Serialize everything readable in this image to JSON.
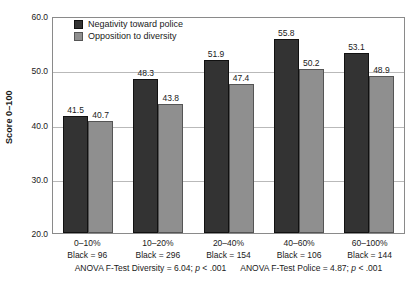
{
  "chart_data": {
    "type": "bar",
    "title": "",
    "xlabel": "",
    "ylabel": "Score 0–100",
    "ylim": [
      20.0,
      60.0
    ],
    "ytick_labels": [
      "60.0",
      "50.0",
      "40.0",
      "30.0",
      "20.0"
    ],
    "ytick_values": [
      60.0,
      50.0,
      40.0,
      30.0,
      20.0
    ],
    "grid": true,
    "legend_position": "top-left-inside",
    "categories": [
      "0–10%",
      "10–20%",
      "20–40%",
      "40–60%",
      "60–100%"
    ],
    "category_sublabels": [
      "Black = 96",
      "Black = 296",
      "Black = 154",
      "Black = 106",
      "Black = 144"
    ],
    "series": [
      {
        "name": "Negativity toward police",
        "color": "#333333",
        "values": [
          41.5,
          48.3,
          51.9,
          55.8,
          53.1
        ],
        "value_labels": [
          "41.5",
          "48.3",
          "51.9",
          "55.8",
          "53.1"
        ]
      },
      {
        "name": "Opposition to diversity",
        "color": "#8f8f8f",
        "values": [
          40.7,
          43.8,
          47.4,
          50.2,
          48.9
        ],
        "value_labels": [
          "40.7",
          "43.8",
          "47.4",
          "50.2",
          "48.9"
        ]
      }
    ],
    "annotations": [
      "ANOVA F-Test Diversity = 6.04; p < .001",
      "ANOVA F-Test Police = 4.87; p < .001"
    ]
  },
  "footnote": {
    "diversity_prefix": "ANOVA F-Test Diversity = 6.04; ",
    "diversity_p_italic": "p",
    "diversity_suffix": " < .001",
    "police_prefix": "ANOVA F-Test Police = 4.87; ",
    "police_p_italic": "p",
    "police_suffix": " < .001"
  }
}
